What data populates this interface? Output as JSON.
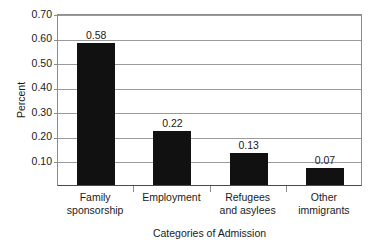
{
  "chart_data": {
    "type": "bar",
    "title": "",
    "xlabel": "Categories of Admission",
    "ylabel": "Percent",
    "categories": [
      "Family sponsorship",
      "Employment",
      "Refugees and asylees",
      "Other immigrants"
    ],
    "category_lines": [
      [
        "Family",
        "sponsorship"
      ],
      [
        "Employment"
      ],
      [
        "Refugees",
        "and asylees"
      ],
      [
        "Other",
        "immigrants"
      ]
    ],
    "values": [
      0.58,
      0.22,
      0.13,
      0.07
    ],
    "value_labels": [
      "0.58",
      "0.22",
      "0.13",
      "0.07"
    ],
    "ylim": [
      0,
      0.7
    ],
    "ytick_values": [
      0.7,
      0.6,
      0.5,
      0.4,
      0.3,
      0.2,
      0.1
    ],
    "ytick_labels": [
      "0.70",
      "0.60",
      "0.50",
      "0.40",
      "0.30",
      "0.20",
      "0.10"
    ],
    "grid": true,
    "legend": false,
    "bar_color": "#111111",
    "grid_color": "#9a9a9a",
    "axis_color": "#8c8c8c",
    "background_color": "#ffffff"
  }
}
